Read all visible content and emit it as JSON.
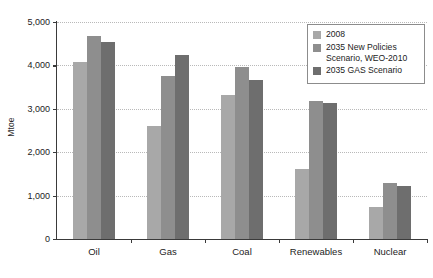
{
  "chart_data": {
    "type": "bar",
    "title": "",
    "xlabel": "",
    "ylabel": "Mtoe",
    "ylim": [
      0,
      5000
    ],
    "yticks": [
      0,
      1000,
      2000,
      3000,
      4000,
      5000
    ],
    "ytick_labels": [
      "0",
      "1,000",
      "2,000",
      "3,000",
      "4,000",
      "5,000"
    ],
    "grid": true,
    "legend_position": "top-right",
    "categories": [
      "Oil",
      "Gas",
      "Coal",
      "Renewables",
      "Nuclear"
    ],
    "series": [
      {
        "name": "2008",
        "color": "#a8a8a8",
        "values": [
          4070,
          2600,
          3310,
          1610,
          740
        ]
      },
      {
        "name": "2035 New Policies Scenario, WEO-2010",
        "color": "#8e8e8e",
        "values": [
          4670,
          3750,
          3960,
          3170,
          1300
        ]
      },
      {
        "name": "2035 GAS Scenario",
        "color": "#6e6e6e",
        "values": [
          4550,
          4250,
          3670,
          3130,
          1230
        ]
      }
    ]
  },
  "legend": {
    "items": [
      {
        "label": "2008",
        "color": "#a8a8a8"
      },
      {
        "label": "2035 New Policies Scenario, WEO-2010",
        "color": "#8e8e8e"
      },
      {
        "label": "2035 GAS Scenario",
        "color": "#6e6e6e"
      }
    ]
  },
  "axes": {
    "y_title": "Mtoe"
  }
}
